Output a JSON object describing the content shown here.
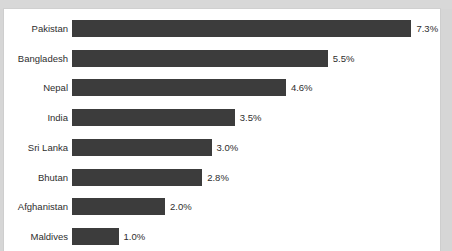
{
  "page": {
    "background_color": "#d6d6d6",
    "card_color": "#ffffff",
    "top_band_ghost_text": ""
  },
  "chart_data": {
    "type": "bar",
    "orientation": "horizontal",
    "title": "",
    "subtitle": "",
    "xlabel": "",
    "ylabel": "",
    "grid": false,
    "legend": null,
    "xlim": [
      0,
      7.8
    ],
    "value_suffix": "%",
    "bar_color": "#3c3c3c",
    "label_color": "#2e2e2e",
    "categories": [
      "Pakistan",
      "Bangladesh",
      "Nepal",
      "India",
      "Sri Lanka",
      "Bhutan",
      "Afghanistan",
      "Maldives"
    ],
    "values": [
      7.3,
      5.5,
      4.6,
      3.5,
      3.0,
      2.8,
      2.0,
      1.0
    ],
    "value_labels": [
      "7.3%",
      "5.5%",
      "4.6%",
      "3.5%",
      "3.0%",
      "2.8%",
      "2.0%",
      "1.0%"
    ],
    "rows": [
      {
        "label": "Pakistan",
        "value": 7.3,
        "value_label": "7.3%"
      },
      {
        "label": "Bangladesh",
        "value": 5.5,
        "value_label": "5.5%"
      },
      {
        "label": "Nepal",
        "value": 4.6,
        "value_label": "4.6%"
      },
      {
        "label": "India",
        "value": 3.5,
        "value_label": "3.5%"
      },
      {
        "label": "Sri Lanka",
        "value": 3.0,
        "value_label": "3.0%"
      },
      {
        "label": "Bhutan",
        "value": 2.8,
        "value_label": "2.8%"
      },
      {
        "label": "Afghanistan",
        "value": 2.0,
        "value_label": "2.0%"
      },
      {
        "label": "Maldives",
        "value": 1.0,
        "value_label": "1.0%"
      }
    ]
  },
  "layout": {
    "bar_origin_x": 68,
    "px_per_unit": 46.5,
    "row_pitch": 29.7,
    "first_row_top": 11,
    "bar_height": 17,
    "value_gap": 5
  }
}
